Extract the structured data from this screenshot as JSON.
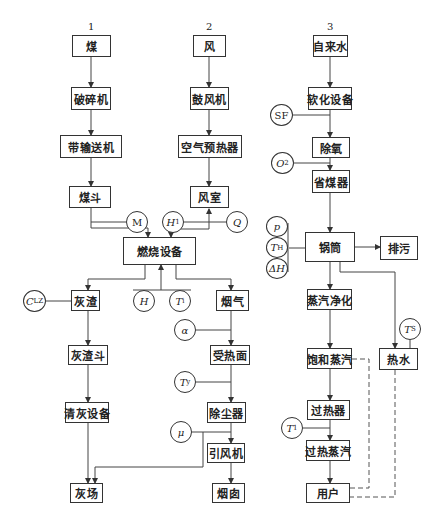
{
  "diagram": {
    "columns": [
      {
        "number": "1",
        "label": "coal-system"
      },
      {
        "number": "2",
        "label": "air-flue-system"
      },
      {
        "number": "3",
        "label": "water-steam-system"
      }
    ],
    "nodes": {
      "coal": "煤",
      "crusher": "破碎机",
      "belt_conveyor": "带输送机",
      "coal_hopper": "煤斗",
      "air": "风",
      "blower": "鼓风机",
      "air_preheater": "空气预热器",
      "wind_chamber": "风室",
      "combustion": "燃烧设备",
      "ash_slag": "灰渣",
      "ash_hopper": "灰渣斗",
      "ash_removal": "清灰设备",
      "ash_yard": "灰场",
      "flue_gas": "烟气",
      "heating_surface": "受热面",
      "dust_collector": "除尘器",
      "induced_fan": "引风机",
      "chimney": "烟囱",
      "tap_water": "自来水",
      "softener": "软化设备",
      "deaerator": "除氧",
      "economizer": "省煤器",
      "drum": "锅筒",
      "blowdown": "排污",
      "steam_purify": "蒸汽净化",
      "saturated_steam": "饱和蒸汽",
      "hot_water": "热水",
      "superheater": "过热器",
      "superheated_steam": "过热蒸汽",
      "user": "用户"
    },
    "sensors": {
      "M": {
        "main": "M",
        "sub": ""
      },
      "H1": {
        "main": "H",
        "sub": "1"
      },
      "Q": {
        "main": "Q",
        "sub": ""
      },
      "CLZ": {
        "main": "C",
        "sub": "LZ"
      },
      "H": {
        "main": "H",
        "sub": ""
      },
      "Ti": {
        "main": "T",
        "sub": "i"
      },
      "alpha": {
        "main": "α",
        "sub": ""
      },
      "Ty": {
        "main": "T",
        "sub": "y"
      },
      "mu": {
        "main": "μ",
        "sub": ""
      },
      "SF": {
        "main": "SF",
        "sub": ""
      },
      "O2": {
        "main": "O",
        "sub": "2"
      },
      "p": {
        "main": "p",
        "sub": ""
      },
      "TH": {
        "main": "T",
        "sub": "H"
      },
      "dH": {
        "main": "ΔH",
        "sub": ""
      },
      "Ts": {
        "main": "T",
        "sub": "S"
      },
      "T1": {
        "main": "T",
        "sub": "1"
      }
    }
  }
}
